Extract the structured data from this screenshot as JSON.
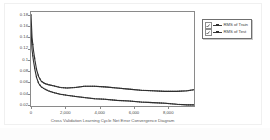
{
  "chart_data": {
    "type": "line",
    "title": "",
    "xlabel": "Cross Validation Learning Cycle Net Error Convergence Diagram",
    "ylabel": "",
    "xlim": [
      0,
      9500
    ],
    "ylim": [
      0.018,
      0.185
    ],
    "grid": false,
    "legend_position": "right-outside",
    "xticks": [
      {
        "value": 0,
        "label": "0"
      },
      {
        "value": 2000,
        "label": "2,000"
      },
      {
        "value": 4000,
        "label": "4,000"
      },
      {
        "value": 6000,
        "label": "6,000"
      },
      {
        "value": 8000,
        "label": "8,000"
      }
    ],
    "yticks": [
      {
        "value": 0.02,
        "label": "0.02"
      },
      {
        "value": 0.04,
        "label": "0.04"
      },
      {
        "value": 0.06,
        "label": "0.06"
      },
      {
        "value": 0.08,
        "label": "0.08"
      },
      {
        "value": 0.1,
        "label": "0.1"
      },
      {
        "value": 0.12,
        "label": "0.12"
      },
      {
        "value": 0.14,
        "label": "0.14"
      },
      {
        "value": 0.16,
        "label": "0.16"
      },
      {
        "value": 0.18,
        "label": "0.18"
      }
    ],
    "series": [
      {
        "name": "RMS of Train",
        "color": "#2f2f2f",
        "marker": "square",
        "x": [
          0,
          60,
          140,
          230,
          330,
          450,
          600,
          800,
          1000,
          1300,
          1700,
          2100,
          2600,
          3100,
          3700,
          4300,
          5000,
          5700,
          6400,
          7100,
          7800,
          8500,
          9100,
          9500
        ],
        "values": [
          0.155,
          0.118,
          0.099,
          0.082,
          0.068,
          0.058,
          0.052,
          0.048,
          0.045,
          0.042,
          0.039,
          0.037,
          0.035,
          0.033,
          0.031,
          0.03,
          0.028,
          0.027,
          0.025,
          0.024,
          0.023,
          0.021,
          0.02,
          0.02
        ]
      },
      {
        "name": "RMS of Test",
        "color": "#2f2f2f",
        "marker": "square",
        "x": [
          0,
          60,
          140,
          230,
          330,
          450,
          600,
          800,
          1000,
          1300,
          1700,
          2100,
          2600,
          3100,
          3700,
          4300,
          5000,
          5700,
          6400,
          7100,
          7800,
          8500,
          9100,
          9500
        ],
        "values": [
          0.18,
          0.14,
          0.118,
          0.099,
          0.082,
          0.07,
          0.062,
          0.058,
          0.056,
          0.054,
          0.051,
          0.05,
          0.051,
          0.053,
          0.053,
          0.052,
          0.05,
          0.048,
          0.046,
          0.045,
          0.044,
          0.044,
          0.045,
          0.047
        ]
      }
    ]
  },
  "legend": {
    "items": [
      {
        "label": "RMS of Train",
        "checked": true
      },
      {
        "label": "RMS of Test",
        "checked": true
      }
    ]
  }
}
